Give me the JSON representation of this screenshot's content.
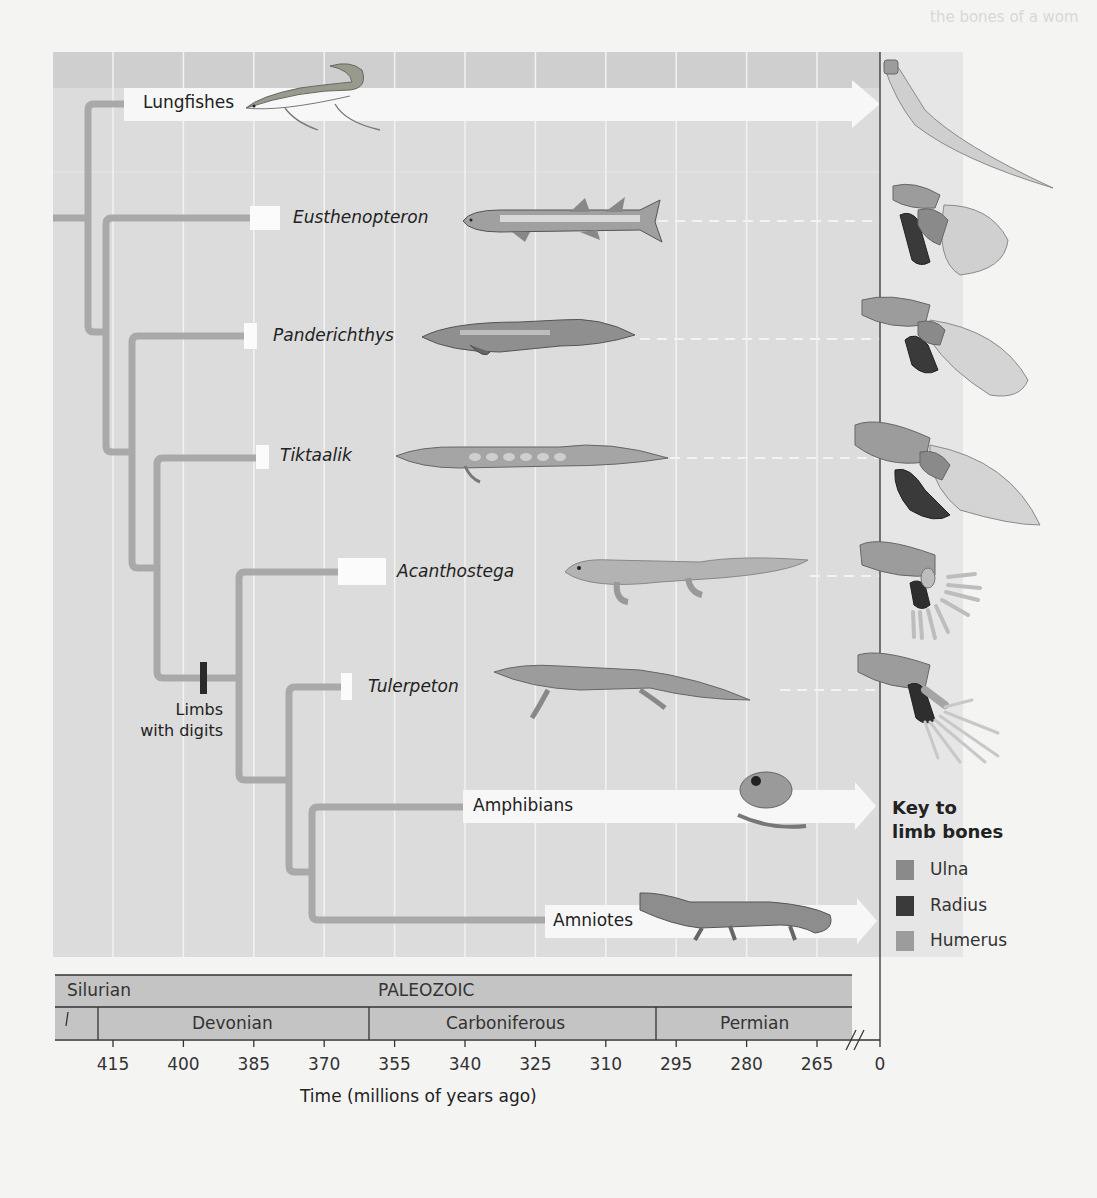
{
  "figure": {
    "type": "cladogram",
    "background_text": [
      "the bones of a wom",
      "ancestral condi",
      "for which lungs",
      "in other tetrapods",
      "tetrapods with 4",
      "lifetime",
      "skeleton in area",
      "CONCEPT CHECK",
      "What character",
      "amniotes (n",
      "for life in a",
      "environment",
      "Figure 27 ..."
    ],
    "taxa": [
      {
        "name": "Lungfishes",
        "italic": false,
        "extant": true,
        "illustration": "lungfish-illustration",
        "limb": "lungfish-fin-bones"
      },
      {
        "name": "Eusthenopteron",
        "italic": true,
        "extant": false,
        "illustration": "eusthenopteron-illustration",
        "limb": "eusthenopteron-fin-bones"
      },
      {
        "name": "Panderichthys",
        "italic": true,
        "extant": false,
        "illustration": "panderichthys-illustration",
        "limb": "panderichthys-fin-bones"
      },
      {
        "name": "Tiktaalik",
        "italic": true,
        "extant": false,
        "illustration": "tiktaalik-illustration",
        "limb": "tiktaalik-fin-bones"
      },
      {
        "name": "Acanthostega",
        "italic": true,
        "extant": false,
        "illustration": "acanthostega-illustration",
        "limb": "acanthostega-limb-bones"
      },
      {
        "name": "Tulerpeton",
        "italic": true,
        "extant": false,
        "illustration": "tulerpeton-illustration",
        "limb": "tulerpeton-limb-bones"
      },
      {
        "name": "Amphibians",
        "italic": false,
        "extant": true,
        "illustration": "frog-illustration"
      },
      {
        "name": "Amniotes",
        "italic": false,
        "extant": true,
        "illustration": "crocodile-illustration"
      }
    ],
    "fossil_ranges_mya": {
      "Eusthenopteron": [
        385,
        379
      ],
      "Panderichthys": [
        386,
        383
      ],
      "Tiktaalik": [
        383,
        380
      ],
      "Acanthostega": [
        365,
        355
      ],
      "Tulerpeton": [
        365,
        362
      ]
    },
    "synapomorphy": {
      "label_line1": "Limbs",
      "label_line2": "with digits"
    },
    "key": {
      "title_line1": "Key to",
      "title_line2": "limb bones",
      "items": [
        {
          "label": "Ulna",
          "color": "#8a8a8a"
        },
        {
          "label": "Radius",
          "color": "#3a3a3a"
        },
        {
          "label": "Humerus",
          "color": "#9c9c9c"
        }
      ]
    },
    "timescale": {
      "era": "PALEOZOIC",
      "periods": [
        "Silurian",
        "Devonian",
        "Carboniferous",
        "Permian"
      ],
      "ticks": [
        "415",
        "400",
        "385",
        "370",
        "355",
        "340",
        "325",
        "310",
        "295",
        "280",
        "265",
        "0"
      ],
      "axis_title": "Time (millions of years ago)"
    },
    "colors": {
      "panel_bg": "#dcdcdc",
      "branch": "#a9a9a9",
      "band": "#bcbcbc",
      "period_bar": "#c4c4c4"
    }
  }
}
